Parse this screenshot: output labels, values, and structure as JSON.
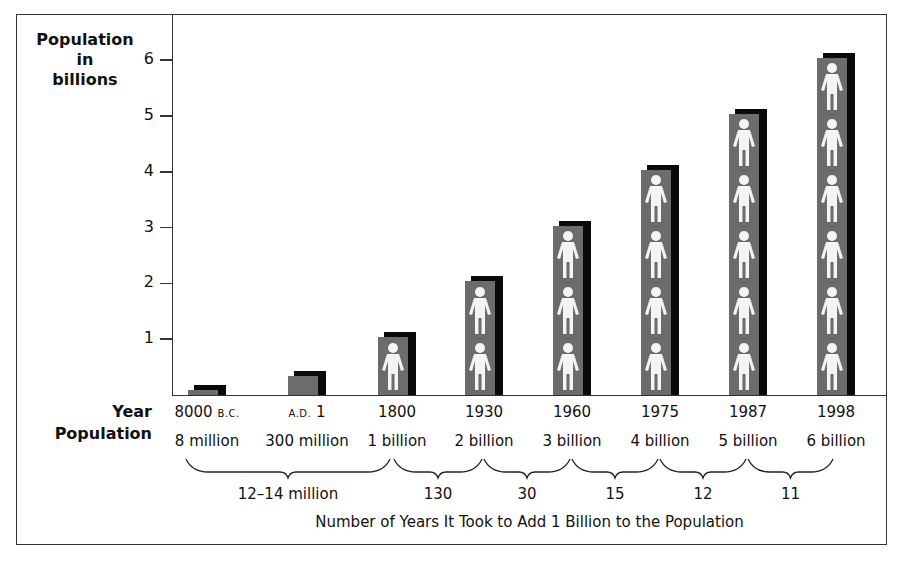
{
  "chart_data": {
    "type": "bar",
    "title": "",
    "ylabel": "Population in billions",
    "xlabel": "Year",
    "ylim": [
      0,
      6.3
    ],
    "yticks": [
      1,
      2,
      3,
      4,
      5,
      6
    ],
    "grid": false,
    "categories": [
      "8000 B.C.",
      "A.D. 1",
      "1800",
      "1930",
      "1960",
      "1975",
      "1987",
      "1998"
    ],
    "values": [
      0.008,
      0.3,
      1,
      2,
      3,
      4,
      5,
      6
    ],
    "population_labels": [
      "8 million",
      "300 million",
      "1 billion",
      "2 billion",
      "3 billion",
      "4 billion",
      "5 billion",
      "6 billion"
    ],
    "years_to_add_billion": [
      {
        "label": "12–14 million",
        "from": "8000 B.C.",
        "to": "1800"
      },
      {
        "label": "130",
        "from": "1800",
        "to": "1930"
      },
      {
        "label": "30",
        "from": "1930",
        "to": "1960"
      },
      {
        "label": "15",
        "from": "1960",
        "to": "1975"
      },
      {
        "label": "12",
        "from": "1975",
        "to": "1987"
      },
      {
        "label": "11",
        "from": "1987",
        "to": "1998"
      }
    ],
    "annotations": [
      "Each person icon represents 1 billion people"
    ],
    "footer": "Number of Years It Took to Add 1 Billion to the Population"
  },
  "axis": {
    "y_title_line1": "Population",
    "y_title_line2": "in",
    "y_title_line3": "billions",
    "ticks": [
      "1",
      "2",
      "3",
      "4",
      "5",
      "6"
    ]
  },
  "rows": {
    "year_label": "Year",
    "population_label": "Population"
  },
  "columns": [
    {
      "year_main": "8000 ",
      "year_small": "B.C.",
      "year_prefix": "",
      "population": "8 million"
    },
    {
      "year_main": " 1",
      "year_small": "",
      "year_prefix": "A.D.",
      "population": "300 million"
    },
    {
      "year_main": "1800",
      "year_small": "",
      "year_prefix": "",
      "population": "1 billion"
    },
    {
      "year_main": "1930",
      "year_small": "",
      "year_prefix": "",
      "population": "2 billion"
    },
    {
      "year_main": "1960",
      "year_small": "",
      "year_prefix": "",
      "population": "3 billion"
    },
    {
      "year_main": "1975",
      "year_small": "",
      "year_prefix": "",
      "population": "4 billion"
    },
    {
      "year_main": "1987",
      "year_small": "",
      "year_prefix": "",
      "population": "5 billion"
    },
    {
      "year_main": "1998",
      "year_small": "",
      "year_prefix": "",
      "population": "6 billion"
    }
  ],
  "intervals": [
    "12–14 million",
    "130",
    "30",
    "15",
    "12",
    "11"
  ],
  "caption": "Number of Years It Took to Add 1 Billion to the Population",
  "colors": {
    "bar_front": "#6c6c6c",
    "bar_shadow": "#0a0a0a",
    "person": "#f4f4f4",
    "frame": "#333333"
  }
}
